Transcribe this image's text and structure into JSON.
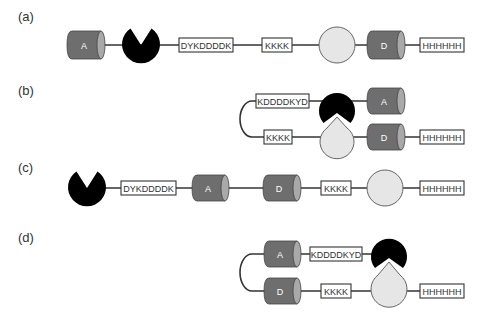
{
  "panels": [
    {
      "id": "a",
      "label": "(a)",
      "layout": "linear",
      "elements": [
        "cylinder A",
        "pacman (binder)",
        "DYKDDDDK",
        "KKKK",
        "circle (target)",
        "cylinder D",
        "HHHHHH"
      ]
    },
    {
      "id": "b",
      "label": "(b)",
      "layout": "folded",
      "top_strand": [
        "KDDDDKYD",
        "pacman (binder)",
        "cylinder A"
      ],
      "bottom_strand": [
        "KKKK",
        "drop (target, bound)",
        "cylinder D",
        "HHHHHH"
      ]
    },
    {
      "id": "c",
      "label": "(c)",
      "layout": "linear",
      "elements": [
        "pacman (binder)",
        "DYKDDDDK",
        "cylinder A",
        "cylinder D",
        "KKKK",
        "circle (target)",
        "HHHHHH"
      ]
    },
    {
      "id": "d",
      "label": "(d)",
      "layout": "folded",
      "top_strand": [
        "cylinder A",
        "KDDDDKYD",
        "pacman (binder)"
      ],
      "bottom_strand": [
        "cylinder D",
        "KKKK",
        "drop (target, bound)",
        "HHHHHH"
      ]
    }
  ],
  "labels": {
    "cyl_a": "A",
    "cyl_d": "D",
    "flag_fwd": "DYKDDDDK",
    "flag_rev": "KDDDDKYD",
    "lys": "KKKK",
    "his": "HHHHHH"
  },
  "colors": {
    "cylinder_body": "#6e6e6e",
    "cylinder_cap": "#a9a9a9",
    "binder": "#000000",
    "target": "#e6e6e6",
    "line": "#333333"
  }
}
